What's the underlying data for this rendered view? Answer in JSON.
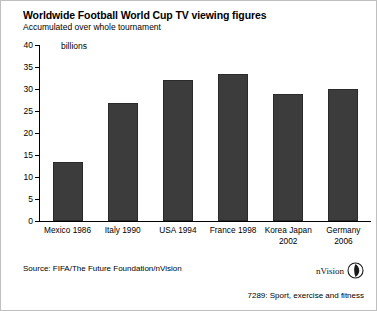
{
  "header": {
    "title": "Worldwide Football World Cup TV viewing figures",
    "subtitle": "Accumulated over whole tournament"
  },
  "footer": {
    "source": "Source: FIFA/The Future Foundation/nVision",
    "brand_name": "nVision",
    "brand_mark_icon": "nvision-leaf-circle-icon",
    "code": "7289: Sport, exercise and fitness"
  },
  "chart_data": {
    "type": "bar",
    "title": "Worldwide Football World Cup TV viewing figures",
    "subtitle": "Accumulated over whole tournament",
    "units_label": "billions",
    "xlabel": "",
    "ylabel": "billions",
    "ylim": [
      0,
      40
    ],
    "yticks": [
      0,
      5,
      10,
      15,
      20,
      25,
      30,
      35,
      40
    ],
    "ytick_labels": [
      "0",
      "5",
      "10",
      "15",
      "20",
      "25",
      "30",
      "35",
      "40"
    ],
    "grid": false,
    "legend": "none",
    "bar_color": "#3c3c3c",
    "categories": [
      "Mexico 1986",
      "Italy 1990",
      "USA 1994",
      "France 1998",
      "Korea Japan 2002",
      "Germany 2006"
    ],
    "category_lines": [
      [
        "Mexico 1986"
      ],
      [
        "Italy 1990"
      ],
      [
        "USA 1994"
      ],
      [
        "France 1998"
      ],
      [
        "Korea Japan",
        "2002"
      ],
      [
        "Germany",
        "2006"
      ]
    ],
    "values": [
      13.3,
      26.9,
      32.0,
      33.4,
      28.8,
      30.0
    ]
  }
}
